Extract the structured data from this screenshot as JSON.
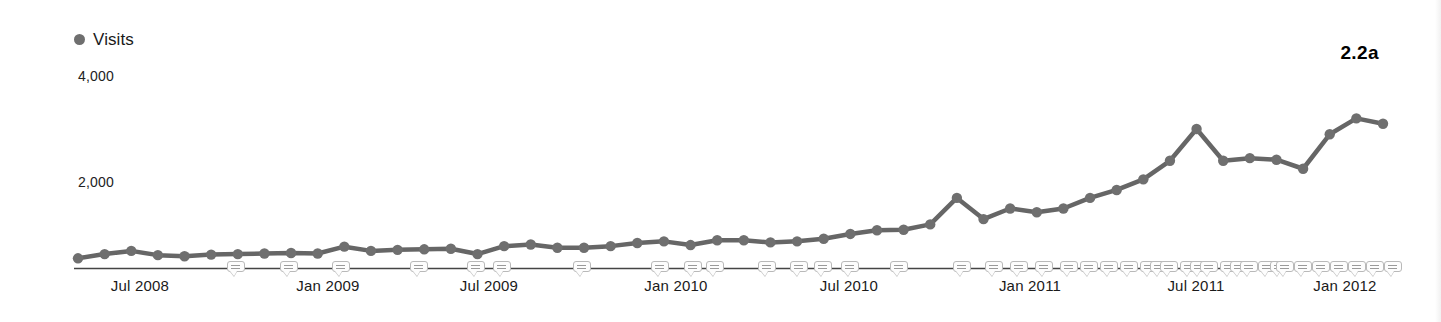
{
  "legend": {
    "marker_color": "#6f6f6f",
    "label": "Visits"
  },
  "figure_tag": "2.2a",
  "axis": {
    "line_color": "#444444",
    "y_ticks": [
      "4,000",
      "2,000"
    ],
    "x_ticks": [
      "Jul 2008",
      "Jan 2009",
      "Jul 2009",
      "Jan 2010",
      "Jul 2010",
      "Jan 2011",
      "Jul 2011",
      "Jan 2012"
    ]
  },
  "chart_data": {
    "type": "line",
    "title": "",
    "subtitle": "",
    "xlabel": "",
    "ylabel": "",
    "grid": false,
    "legend_position": "top-left",
    "series_color": "#666666",
    "marker_color": "#6f6f6f",
    "ylim": [
      0,
      4600
    ],
    "ytick_values": [
      4000,
      2000
    ],
    "xtick_labels": [
      "Jul 2008",
      "Jan 2009",
      "Jul 2009",
      "Jan 2010",
      "Jul 2010",
      "Jan 2011",
      "Jul 2011",
      "Jan 2012"
    ],
    "xtick_x": [
      "2008-07",
      "2009-01",
      "2009-07",
      "2010-01",
      "2010-07",
      "2011-01",
      "2011-07",
      "2012-01"
    ],
    "series": [
      {
        "name": "Visits",
        "x": [
          "2008-04",
          "2008-05",
          "2008-06",
          "2008-07",
          "2008-08",
          "2008-09",
          "2008-10",
          "2008-11",
          "2008-12",
          "2009-01",
          "2009-02",
          "2009-03",
          "2009-04",
          "2009-05",
          "2009-06",
          "2009-07",
          "2009-08",
          "2009-09",
          "2009-10",
          "2009-11",
          "2009-12",
          "2010-01",
          "2010-02",
          "2010-03",
          "2010-04",
          "2010-05",
          "2010-06",
          "2010-07",
          "2010-08",
          "2010-09",
          "2010-10",
          "2010-11",
          "2010-12",
          "2011-01",
          "2011-02",
          "2011-03",
          "2011-04",
          "2011-05",
          "2011-06",
          "2011-07",
          "2011-08",
          "2011-09",
          "2011-10",
          "2011-11",
          "2011-12",
          "2012-01",
          "2012-02",
          "2012-03",
          "2012-04",
          "2012-05"
        ],
        "values": [
          560,
          640,
          700,
          620,
          600,
          630,
          640,
          650,
          660,
          650,
          780,
          700,
          720,
          730,
          740,
          640,
          790,
          820,
          760,
          760,
          790,
          850,
          880,
          810,
          900,
          900,
          860,
          880,
          930,
          1020,
          1090,
          1100,
          1200,
          1700,
          1300,
          1500,
          1430,
          1500,
          1700,
          1850,
          2050,
          2400,
          3000,
          2400,
          2450,
          2420,
          2250,
          2900,
          3200,
          3100
        ]
      }
    ],
    "annotations_count": 41,
    "annotations_note": "small callout markers placed on the x-axis"
  }
}
